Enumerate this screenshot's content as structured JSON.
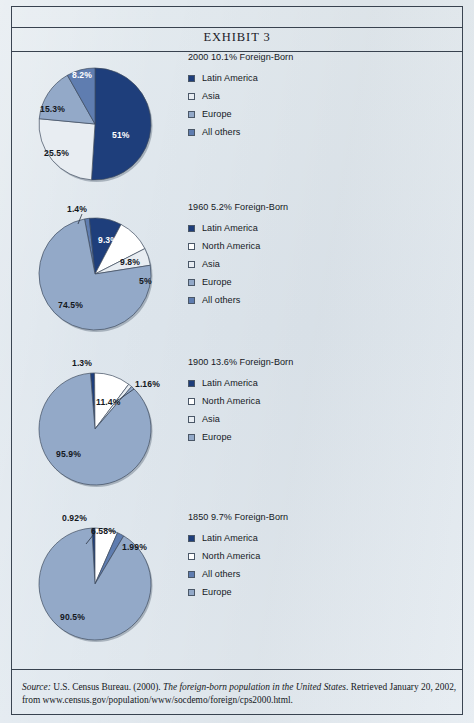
{
  "page": {
    "exhibit_title": "EXHIBIT 3",
    "background_color": "#dfe6ec",
    "rule_color": "#38424f"
  },
  "palette": {
    "latin_america": "#1e3e7b",
    "north_america": "#ffffff",
    "asia": "#e8edf2",
    "europe": "#93a9c8",
    "all_others": "#5f7db0"
  },
  "source": {
    "label": "Source:",
    "text_1": " U.S. Census Bureau. (2000). ",
    "italic": "The foreign-born population in the United States",
    "text_2": ". Retrieved January 20, 2002, from www.census.gov/population/www/socdemo/foreign/cps2000.html."
  },
  "chart_data": [
    {
      "type": "pie",
      "title": "2000 10.1% Foreign-Born",
      "year": "2000",
      "foreign_born_pct": "10.1%",
      "categories": [
        "Latin America",
        "Asia",
        "Europe",
        "All others"
      ],
      "values": [
        51,
        25.5,
        15.3,
        8.2
      ],
      "labels": [
        "51%",
        "25.5%",
        "15.3%",
        "8.2%"
      ],
      "colors": [
        "#1e3e7b",
        "#e8edf2",
        "#93a9c8",
        "#5f7db0"
      ],
      "legend_position": "right",
      "label_positions": [
        {
          "x": 78,
          "y": 78,
          "dark": true
        },
        {
          "x": 10,
          "y": 96,
          "dark": false
        },
        {
          "x": 6,
          "y": 52,
          "dark": false
        },
        {
          "x": 38,
          "y": 18,
          "dark": true
        }
      ]
    },
    {
      "type": "pie",
      "title": "1960 5.2% Foreign-Born",
      "year": "1960",
      "foreign_born_pct": "5.2%",
      "categories": [
        "Latin America",
        "North America",
        "Asia",
        "Europe",
        "All others"
      ],
      "values": [
        9.3,
        9.8,
        5,
        74.5,
        1.4
      ],
      "labels": [
        "9.3%",
        "9.8%",
        "5%",
        "74.5%",
        "1.4%"
      ],
      "colors": [
        "#1e3e7b",
        "#ffffff",
        "#e8edf2",
        "#93a9c8",
        "#5f7db0"
      ],
      "legend_position": "right",
      "label_positions": [
        {
          "x": 64,
          "y": 33,
          "dark": true
        },
        {
          "x": 86,
          "y": 55,
          "dark": false
        },
        {
          "x": 105,
          "y": 74,
          "dark": false
        },
        {
          "x": 24,
          "y": 98,
          "dark": false
        },
        {
          "x": 33,
          "y": 2,
          "dark": false
        }
      ]
    },
    {
      "type": "pie",
      "title": "1900 13.6% Foreign-Born",
      "year": "1900",
      "foreign_born_pct": "13.6%",
      "categories": [
        "Latin America",
        "North America",
        "Asia",
        "Europe"
      ],
      "values": [
        1.3,
        11.4,
        1.16,
        95.9
      ],
      "labels": [
        "1.3%",
        "11.4%",
        "1.16%",
        "95.9%"
      ],
      "colors": [
        "#1e3e7b",
        "#ffffff",
        "#e8edf2",
        "#93a9c8"
      ],
      "legend_position": "right",
      "label_positions": [
        {
          "x": 38,
          "y": 1,
          "dark": false
        },
        {
          "x": 62,
          "y": 40,
          "dark": false
        },
        {
          "x": 101,
          "y": 22,
          "dark": false
        },
        {
          "x": 22,
          "y": 92,
          "dark": false
        }
      ]
    },
    {
      "type": "pie",
      "title": "1850 9.7% Foreign-Born",
      "year": "1850",
      "foreign_born_pct": "9.7%",
      "categories": [
        "Latin America",
        "North America",
        "All others",
        "Europe"
      ],
      "values": [
        0.92,
        6.58,
        1.99,
        90.5
      ],
      "labels": [
        "0.92%",
        "6.58%",
        "1.99%",
        "90.5%"
      ],
      "colors": [
        "#1e3e7b",
        "#ffffff",
        "#5f7db0",
        "#93a9c8"
      ],
      "legend_position": "right",
      "label_positions": [
        {
          "x": 28,
          "y": 1,
          "dark": false
        },
        {
          "x": 57,
          "y": 14,
          "dark": false
        },
        {
          "x": 88,
          "y": 30,
          "dark": false
        },
        {
          "x": 26,
          "y": 100,
          "dark": false
        }
      ]
    }
  ]
}
